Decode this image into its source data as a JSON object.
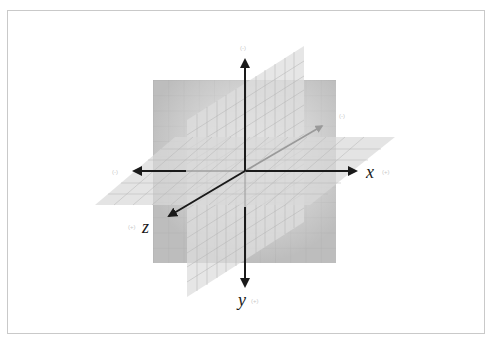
{
  "diagram": {
    "type": "3d-coordinate-system",
    "axes": {
      "x": {
        "label": "x",
        "positive_sign": "(+)",
        "negative_sign": "(-)"
      },
      "y": {
        "label": "y",
        "positive_sign": "(+)",
        "negative_sign": "(-)"
      },
      "z": {
        "label": "z",
        "positive_sign": "(+)",
        "negative_sign": "(-)"
      }
    },
    "planes": [
      "xy-plane",
      "yz-plane",
      "xz-plane"
    ],
    "colors": {
      "frame_border": "#c9c9c9",
      "axis": "#1a1a1a",
      "back_axis": "#9a9a9a",
      "plane_front": "#bdbdbd",
      "plane_side": "#d0d0d0",
      "plane_horizontal": "#d6d6d6",
      "grid_line": "#a8a8a8",
      "sign_label": "#c8c8c8"
    }
  }
}
